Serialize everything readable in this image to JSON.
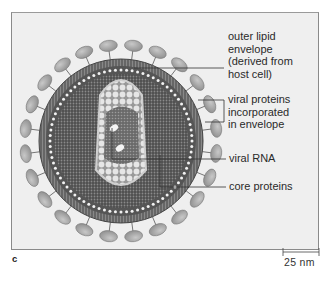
{
  "figure": {
    "panel_letter": "c",
    "scale_bar": {
      "label": "25 nm"
    },
    "colors": {
      "background": "#efefef",
      "spike": "#a9a9a9",
      "envelope": "#6f6f6f",
      "matrix": "#5e5e5e",
      "core": "#d8d8d8",
      "line": "#333333"
    }
  },
  "labels": [
    {
      "id": "outer-lipid-envelope",
      "lines": [
        "outer lipid",
        "envelope",
        "(derived from",
        "host cell)"
      ]
    },
    {
      "id": "viral-proteins",
      "lines": [
        "viral proteins",
        "incorporated",
        "in envelope"
      ]
    },
    {
      "id": "viral-rna",
      "lines": [
        "viral RNA"
      ]
    },
    {
      "id": "core-proteins",
      "lines": [
        "core proteins"
      ]
    }
  ]
}
